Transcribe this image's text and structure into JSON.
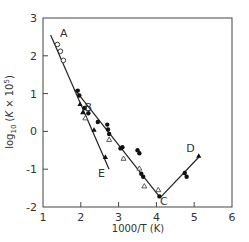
{
  "chart_data": {
    "type": "scatter",
    "title": "",
    "xlabel": "1000/T (K)",
    "ylabel": "log10 (K × 10^5)",
    "xlim": [
      1,
      6
    ],
    "ylim": [
      -2,
      3
    ],
    "xticks": [
      1,
      2,
      3,
      4,
      5,
      6
    ],
    "yticks": [
      -2,
      -1,
      0,
      1,
      2,
      3
    ],
    "grid": false,
    "legend": null,
    "annotations": [
      {
        "text": "A",
        "x": 1.55,
        "y": 2.5
      },
      {
        "text": "B",
        "x": 2.2,
        "y": 0.55
      },
      {
        "text": "C",
        "x": 4.2,
        "y": -1.95
      },
      {
        "text": "D",
        "x": 4.9,
        "y": -0.55
      },
      {
        "text": "E",
        "x": 2.55,
        "y": -1.2
      }
    ],
    "lines": [
      {
        "name": "A-E",
        "points": [
          [
            1.2,
            2.55
          ],
          [
            2.75,
            -1.0
          ]
        ]
      },
      {
        "name": "B-C",
        "points": [
          [
            1.85,
            1.1
          ],
          [
            4.1,
            -1.75
          ]
        ]
      },
      {
        "name": "C-D",
        "points": [
          [
            4.1,
            -1.75
          ],
          [
            5.15,
            -0.65
          ]
        ]
      }
    ],
    "series": [
      {
        "name": "open circles",
        "marker": "open-circle",
        "points": [
          [
            1.38,
            2.3
          ],
          [
            1.46,
            2.12
          ],
          [
            1.54,
            1.88
          ]
        ]
      },
      {
        "name": "filled circles",
        "marker": "filled-circle",
        "points": [
          [
            1.92,
            1.08
          ],
          [
            1.96,
            0.95
          ],
          [
            2.1,
            0.62
          ],
          [
            2.2,
            0.48
          ],
          [
            2.45,
            0.25
          ],
          [
            2.7,
            0.18
          ],
          [
            2.72,
            0.05
          ],
          [
            2.75,
            -0.07
          ],
          [
            3.05,
            -0.45
          ],
          [
            3.1,
            -0.42
          ],
          [
            3.5,
            -0.5
          ],
          [
            3.55,
            -0.58
          ],
          [
            3.6,
            -1.12
          ],
          [
            3.65,
            -1.2
          ],
          [
            4.08,
            -1.72
          ],
          [
            4.75,
            -1.1
          ],
          [
            4.8,
            -1.2
          ]
        ]
      },
      {
        "name": "filled triangles",
        "marker": "filled-triangle",
        "points": [
          [
            1.98,
            0.72
          ],
          [
            2.05,
            0.5
          ],
          [
            2.35,
            0.04
          ],
          [
            2.65,
            -0.68
          ],
          [
            5.12,
            -0.65
          ]
        ]
      },
      {
        "name": "open triangles",
        "marker": "open-triangle",
        "points": [
          [
            2.12,
            0.35
          ],
          [
            2.75,
            -0.22
          ],
          [
            3.13,
            -0.72
          ],
          [
            3.55,
            -0.98
          ],
          [
            3.68,
            -1.45
          ],
          [
            4.05,
            -1.55
          ]
        ]
      }
    ]
  },
  "axes": {
    "x_title": "1000/T  (K)",
    "y_title": "log10 (K × 10⁵)",
    "x_ticks": [
      "1",
      "2",
      "3",
      "4",
      "5",
      "6"
    ],
    "y_ticks": [
      "3",
      "2",
      "1",
      "0",
      "-1",
      "-2"
    ]
  },
  "labels": {
    "A": "A",
    "B": "B",
    "C": "C",
    "D": "D",
    "E": "E"
  }
}
